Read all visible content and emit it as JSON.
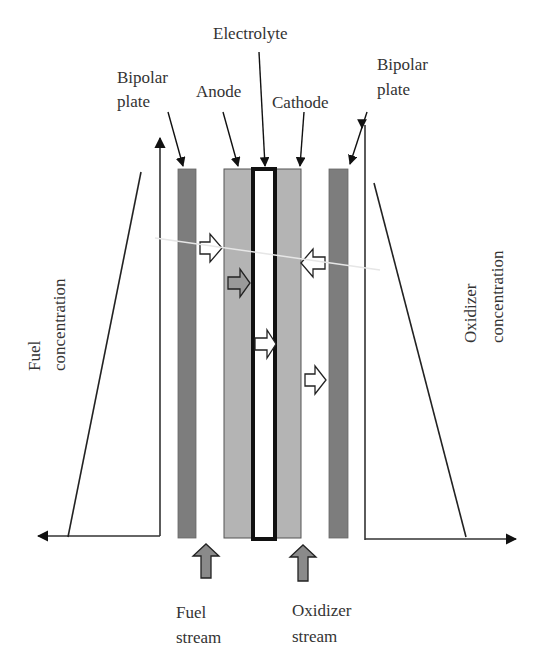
{
  "labels": {
    "electrolyte": "Electrolyte",
    "bipolar_plate_left_line1": "Bipolar",
    "bipolar_plate_left_line2": "plate",
    "anode": "Anode",
    "cathode": "Cathode",
    "bipolar_plate_right_line1": "Bipolar",
    "bipolar_plate_right_line2": "plate",
    "fuel_concentration_line1": "Fuel",
    "fuel_concentration_line2": "concentration",
    "oxidizer_concentration_line1": "Oxidizer",
    "oxidizer_concentration_line2": "concentration",
    "fuel_stream_line1": "Fuel",
    "fuel_stream_line2": "stream",
    "oxidizer_stream_line1": "Oxidizer",
    "oxidizer_stream_line2": "stream"
  },
  "components": [
    {
      "name": "Bipolar plate (fuel side)",
      "color": "#7d7d7d"
    },
    {
      "name": "Anode",
      "color": "#b4b4b4"
    },
    {
      "name": "Electrolyte",
      "color": "#ffffff",
      "border": "#111111"
    },
    {
      "name": "Cathode",
      "color": "#b4b4b4"
    },
    {
      "name": "Bipolar plate (oxidizer side)",
      "color": "#7d7d7d"
    }
  ],
  "flow_arrows": [
    {
      "type": "fuel diffusion",
      "direction": "right",
      "fill": "#ffffff"
    },
    {
      "type": "anode reaction",
      "direction": "right",
      "fill": "#9a9a9a"
    },
    {
      "type": "ion transport",
      "direction": "right",
      "fill": "#ffffff"
    },
    {
      "type": "oxidizer diffusion",
      "direction": "left",
      "fill": "#ffffff"
    },
    {
      "type": "product",
      "direction": "right",
      "fill": "#ffffff"
    },
    {
      "type": "fuel stream inlet",
      "direction": "up",
      "fill": "#8a8a8a"
    },
    {
      "type": "oxidizer stream inlet",
      "direction": "up",
      "fill": "#8a8a8a"
    }
  ],
  "concentration_profiles": {
    "fuel": "decreasing toward anode (right-to-left rising)",
    "oxidizer": "decreasing away from cathode"
  }
}
